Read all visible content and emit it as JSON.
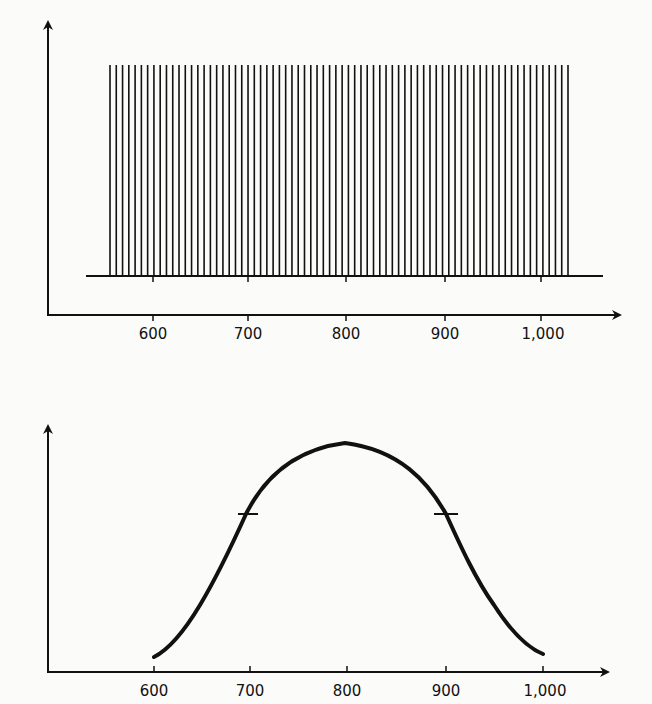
{
  "chart_data": [
    {
      "id": "top",
      "type": "bar",
      "title": "",
      "xlabel": "",
      "ylabel": "",
      "description": "Uniform comb of equal-height vertical lines (discrete spectrum) standing on a baseline",
      "x_ticks": [
        600,
        700,
        800,
        900,
        1000
      ],
      "x_tick_labels": [
        "600",
        "700",
        "800",
        "900",
        "1,000"
      ],
      "xlim": [
        545,
        1080
      ],
      "bar_range": [
        560,
        1035
      ],
      "bar_count": 74,
      "bar_height": 1.0,
      "ylim": [
        0,
        1.1
      ],
      "grid": false,
      "legend": null
    },
    {
      "id": "bottom",
      "type": "line",
      "title": "",
      "xlabel": "",
      "ylabel": "",
      "description": "Bell-shaped envelope curve with half-maximum markers at 700 and 900",
      "x_ticks": [
        600,
        700,
        800,
        900,
        1000
      ],
      "x_tick_labels": [
        "600",
        "700",
        "800",
        "900",
        "1,000"
      ],
      "xlim": [
        545,
        1080
      ],
      "ylim": [
        0,
        1.1
      ],
      "x": [
        600,
        622,
        648,
        674,
        700,
        724,
        755,
        800,
        845,
        876,
        900,
        926,
        952,
        978,
        1000
      ],
      "values": [
        0.05,
        0.12,
        0.27,
        0.45,
        0.5,
        0.8,
        0.93,
        1.0,
        0.93,
        0.8,
        0.5,
        0.45,
        0.27,
        0.12,
        0.06
      ],
      "annotations": [
        {
          "type": "half-max-marker",
          "x": 700,
          "y": 0.5
        },
        {
          "type": "half-max-marker",
          "x": 900,
          "y": 0.5
        }
      ],
      "grid": false,
      "legend": null
    }
  ],
  "axes": {
    "top": {
      "tick_labels": [
        "600",
        "700",
        "800",
        "900",
        "1,000"
      ]
    },
    "bottom": {
      "tick_labels": [
        "600",
        "700",
        "800",
        "900",
        "1,000"
      ]
    }
  },
  "style": {
    "ink_color": "#111111",
    "background_color": "#fbfbfa"
  }
}
